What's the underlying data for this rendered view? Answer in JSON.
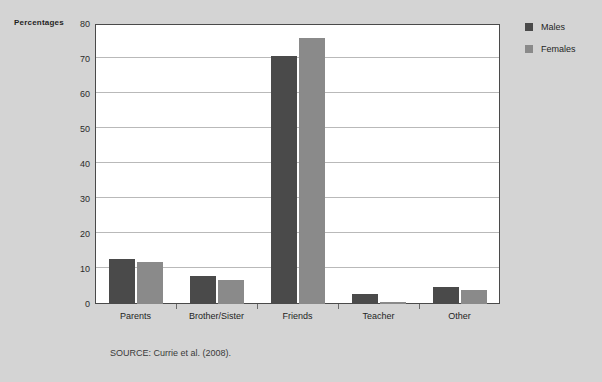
{
  "figure": {
    "background_color": "#d4d4d4",
    "plot_background_color": "#ffffff",
    "source_note": "SOURCE: Currie et al. (2008).",
    "y_axis_title": "Percentages"
  },
  "legend": {
    "position": "right",
    "entries": [
      {
        "label": "Males",
        "color": "#4a4a4a"
      },
      {
        "label": "Females",
        "color": "#8a8a8a"
      }
    ]
  },
  "chart_data": {
    "type": "bar",
    "title": "",
    "subtitle": "",
    "xlabel": "",
    "ylabel": "Percentages",
    "ylim": [
      0,
      80
    ],
    "yticks": [
      0,
      10,
      20,
      30,
      40,
      50,
      60,
      70,
      80
    ],
    "ytick_labels": [
      "0",
      "10",
      "20",
      "30",
      "40",
      "50",
      "60",
      "70",
      "80"
    ],
    "grid": true,
    "grid_axis": "y",
    "categories": [
      "Parents",
      "Brother/Sister",
      "Friends",
      "Teacher",
      "Other"
    ],
    "series": [
      {
        "name": "Males",
        "color": "#4a4a4a",
        "values": [
          13,
          8,
          71,
          3,
          5
        ]
      },
      {
        "name": "Females",
        "color": "#8a8a8a",
        "values": [
          12,
          7,
          76,
          0.5,
          4
        ]
      }
    ],
    "annotations": [
      "SOURCE: Currie et al. (2008)."
    ]
  }
}
